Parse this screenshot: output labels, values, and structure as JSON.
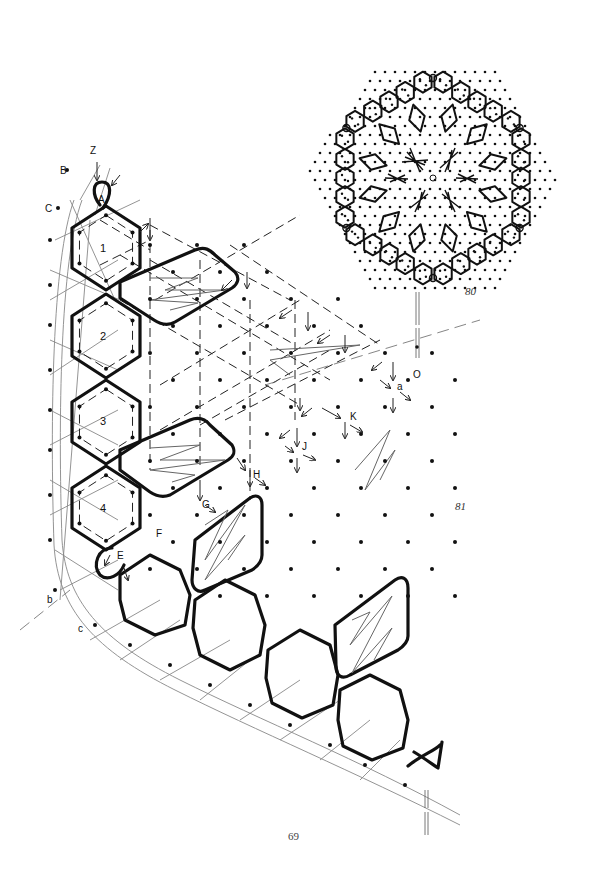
{
  "page": {
    "page_number": "69",
    "background": "#ffffff",
    "ink_color": "#111111",
    "thread_color": "#888888"
  },
  "figures": [
    {
      "id": "80",
      "label": "80",
      "description": "Hexagonal round lace motif: ring of hexagon cloth-stitch cells and diamond tallies around a ground of dots, with six leaf tallies about a central pin O",
      "center_label": "O"
    },
    {
      "id": "81",
      "label": "81",
      "description": "Corner section of bobbin lace pricking with numbered hexagons, diamond tallies, and working-direction arrows",
      "hexagon_labels": [
        "1",
        "2",
        "3",
        "4"
      ],
      "point_labels": [
        "Z",
        "B",
        "C",
        "A",
        "E",
        "F",
        "G",
        "H",
        "J",
        "K",
        "a",
        "b",
        "c",
        "O"
      ]
    }
  ]
}
